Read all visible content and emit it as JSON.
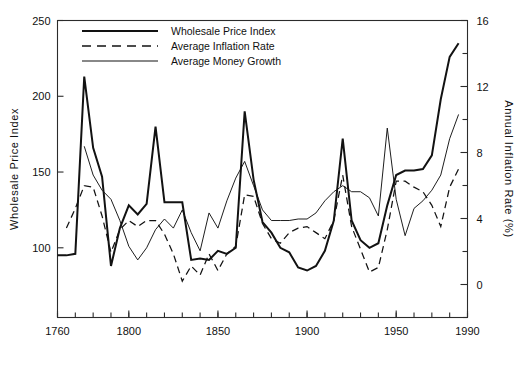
{
  "chart_data": {
    "type": "line",
    "title": "",
    "subtitle": "",
    "xlabel": "",
    "ylabel": "Wholesale  Price  Index",
    "y2label": "Annual Inflation Rate (%)",
    "xlim": [
      1760,
      1990
    ],
    "ylim": [
      54,
      250
    ],
    "y2lim": [
      -2,
      16
    ],
    "grid": false,
    "legend_position": "top-left-inside",
    "xticks": [
      1760,
      1800,
      1850,
      1900,
      1950,
      1990
    ],
    "xticks_minor_step": 10,
    "yticks": [
      100,
      150,
      200,
      250
    ],
    "y2ticks": [
      0,
      4,
      8,
      12,
      16
    ],
    "y2ticks_minor": [
      -2,
      2,
      6,
      10,
      14
    ],
    "axis_note": "Right axis maps inflation/money-growth percent onto the same drawing area; left axis is the index level.",
    "series": [
      {
        "name": "Wholesale Price Index",
        "style": "solid-thick",
        "color": "#121212",
        "x": [
          1760,
          1765,
          1770,
          1775,
          1780,
          1785,
          1790,
          1795,
          1800,
          1805,
          1810,
          1815,
          1820,
          1825,
          1830,
          1835,
          1840,
          1845,
          1850,
          1855,
          1860,
          1865,
          1870,
          1875,
          1880,
          1885,
          1890,
          1895,
          1900,
          1905,
          1910,
          1915,
          1920,
          1925,
          1930,
          1935,
          1940,
          1945,
          1950,
          1955,
          1960,
          1965,
          1970,
          1975,
          1980,
          1985
        ],
        "y": [
          95,
          95,
          96,
          213,
          166,
          147,
          88,
          113,
          128,
          122,
          129,
          180,
          130,
          130,
          130,
          92,
          93,
          92,
          98,
          96,
          100,
          190,
          145,
          117,
          110,
          100,
          97,
          87,
          85,
          88,
          98,
          118,
          172,
          118,
          105,
          100,
          103,
          128,
          148,
          151,
          151,
          152,
          161,
          198,
          226,
          235
        ]
      },
      {
        "name": "Average Inflation Rate",
        "style": "dashed",
        "color": "#121212",
        "x": [
          1765,
          1770,
          1775,
          1780,
          1785,
          1790,
          1795,
          1800,
          1805,
          1810,
          1815,
          1820,
          1825,
          1830,
          1835,
          1840,
          1845,
          1850,
          1855,
          1860,
          1865,
          1870,
          1875,
          1880,
          1885,
          1890,
          1895,
          1900,
          1905,
          1910,
          1915,
          1920,
          1925,
          1930,
          1935,
          1940,
          1945,
          1950,
          1955,
          1960,
          1965,
          1970,
          1975,
          1980,
          1985
        ],
        "y": [
          113,
          126,
          141,
          140,
          121,
          97,
          112,
          118,
          114,
          118,
          118,
          109,
          96,
          78,
          88,
          82,
          96,
          85,
          96,
          101,
          135,
          134,
          116,
          106,
          103,
          110,
          113,
          114,
          110,
          106,
          118,
          148,
          114,
          99,
          84,
          87,
          112,
          144,
          144,
          140,
          137,
          128,
          114,
          140,
          152
        ]
      },
      {
        "name": "Average Money Growth",
        "style": "solid-thin",
        "color": "#121212",
        "x": [
          1775,
          1780,
          1785,
          1790,
          1795,
          1800,
          1805,
          1810,
          1815,
          1820,
          1825,
          1830,
          1835,
          1840,
          1845,
          1850,
          1855,
          1860,
          1865,
          1870,
          1875,
          1880,
          1885,
          1890,
          1895,
          1900,
          1905,
          1910,
          1915,
          1920,
          1925,
          1930,
          1935,
          1940,
          1945,
          1950,
          1955,
          1960,
          1965,
          1970,
          1975,
          1980,
          1985
        ],
        "y": [
          167,
          148,
          138,
          132,
          118,
          101,
          92,
          100,
          112,
          119,
          113,
          125,
          110,
          98,
          123,
          113,
          131,
          146,
          157,
          141,
          125,
          118,
          118,
          118,
          119,
          119,
          123,
          131,
          137,
          141,
          137,
          137,
          133,
          121,
          179,
          132,
          108,
          126,
          131,
          138,
          148,
          172,
          188
        ]
      }
    ]
  },
  "legend": {
    "entries": [
      {
        "label": "Wholesale Price Index",
        "style": "solid-thick"
      },
      {
        "label": "Average Inflation Rate",
        "style": "dashed"
      },
      {
        "label": "Average Money Growth",
        "style": "solid-thin"
      }
    ]
  },
  "axes": {
    "left_title": "Wholesale  Price  Index",
    "right_title": "Annual Inflation Rate (%)",
    "y_tick_labels": [
      "250",
      "200",
      "150",
      "100"
    ],
    "y2_tick_labels": [
      "16",
      "12",
      "8",
      "4",
      "0"
    ],
    "x_tick_labels": [
      "1760",
      "1800",
      "1850",
      "1900",
      "1950",
      "1990"
    ]
  },
  "colors": {
    "ink": "#121212",
    "frame": "#2b2b2b",
    "background": "#ffffff"
  }
}
